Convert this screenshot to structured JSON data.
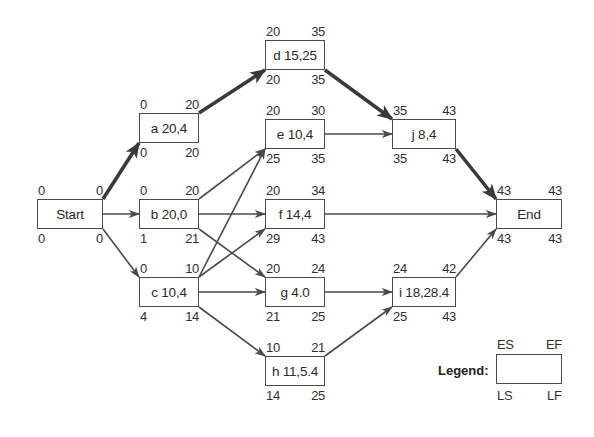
{
  "diagram": {
    "type": "activity-on-node network (CPM/PERT)",
    "nodes": [
      {
        "id": "start",
        "label": "Start",
        "ES": "0",
        "EF": "0",
        "LS": "0",
        "LF": "0",
        "x": 37,
        "y": 199,
        "w": 66,
        "h": 30
      },
      {
        "id": "a",
        "label": "a 20,4",
        "ES": "0",
        "EF": "20",
        "LS": "0",
        "LF": "20",
        "x": 139,
        "y": 113,
        "w": 60,
        "h": 30
      },
      {
        "id": "b",
        "label": "b 20,0",
        "ES": "0",
        "EF": "20",
        "LS": "1",
        "LF": "21",
        "x": 139,
        "y": 199,
        "w": 60,
        "h": 30
      },
      {
        "id": "c",
        "label": "c 10,4",
        "ES": "0",
        "EF": "10",
        "LS": "4",
        "LF": "14",
        "x": 139,
        "y": 277,
        "w": 60,
        "h": 30
      },
      {
        "id": "d",
        "label": "d 15,25",
        "ES": "20",
        "EF": "35",
        "LS": "20",
        "LF": "35",
        "x": 265,
        "y": 40,
        "w": 60,
        "h": 30
      },
      {
        "id": "e",
        "label": "e 10,4",
        "ES": "20",
        "EF": "30",
        "LS": "25",
        "LF": "35",
        "x": 265,
        "y": 119,
        "w": 60,
        "h": 30
      },
      {
        "id": "f",
        "label": "f 14,4",
        "ES": "20",
        "EF": "34",
        "LS": "29",
        "LF": "43",
        "x": 265,
        "y": 199,
        "w": 60,
        "h": 30
      },
      {
        "id": "g",
        "label": "g 4.0",
        "ES": "20",
        "EF": "24",
        "LS": "21",
        "LF": "25",
        "x": 265,
        "y": 277,
        "w": 60,
        "h": 30
      },
      {
        "id": "h",
        "label": "h 11,5.4",
        "ES": "10",
        "EF": "21",
        "LS": "14",
        "LF": "25",
        "x": 265,
        "y": 356,
        "w": 60,
        "h": 30
      },
      {
        "id": "j",
        "label": "j 8,4",
        "ES": "35",
        "EF": "43",
        "LS": "35",
        "LF": "43",
        "x": 392,
        "y": 119,
        "w": 64,
        "h": 30
      },
      {
        "id": "i",
        "label": "i 18,28.4",
        "ES": "24",
        "EF": "42",
        "LS": "25",
        "LF": "43",
        "x": 392,
        "y": 277,
        "w": 64,
        "h": 30
      },
      {
        "id": "end",
        "label": "End",
        "ES": "43",
        "EF": "43",
        "LS": "43",
        "LF": "43",
        "x": 496,
        "y": 199,
        "w": 66,
        "h": 30
      }
    ],
    "edges": [
      {
        "from": "start",
        "to": "a",
        "critical": true
      },
      {
        "from": "start",
        "to": "b",
        "critical": false
      },
      {
        "from": "start",
        "to": "c",
        "critical": false
      },
      {
        "from": "a",
        "to": "d",
        "critical": true
      },
      {
        "from": "b",
        "to": "e",
        "critical": false
      },
      {
        "from": "b",
        "to": "f",
        "critical": false
      },
      {
        "from": "b",
        "to": "g",
        "critical": false
      },
      {
        "from": "c",
        "to": "e",
        "critical": false
      },
      {
        "from": "c",
        "to": "f",
        "critical": false
      },
      {
        "from": "c",
        "to": "g",
        "critical": false
      },
      {
        "from": "c",
        "to": "h",
        "critical": false
      },
      {
        "from": "d",
        "to": "j",
        "critical": true
      },
      {
        "from": "e",
        "to": "j",
        "critical": false
      },
      {
        "from": "f",
        "to": "end",
        "critical": false
      },
      {
        "from": "g",
        "to": "i",
        "critical": false
      },
      {
        "from": "h",
        "to": "i",
        "critical": false
      },
      {
        "from": "j",
        "to": "end",
        "critical": true
      },
      {
        "from": "i",
        "to": "end",
        "critical": false
      }
    ],
    "legend": {
      "title": "Legend:",
      "top_left": "ES",
      "top_right": "EF",
      "bottom_left": "LS",
      "bottom_right": "LF",
      "x": 496,
      "y": 354,
      "w": 66,
      "h": 30
    },
    "colors": {
      "line": "#4a4a4a",
      "critical_line": "#3a3a3a",
      "text": "#2a2a2a",
      "background": "#ffffff"
    }
  }
}
